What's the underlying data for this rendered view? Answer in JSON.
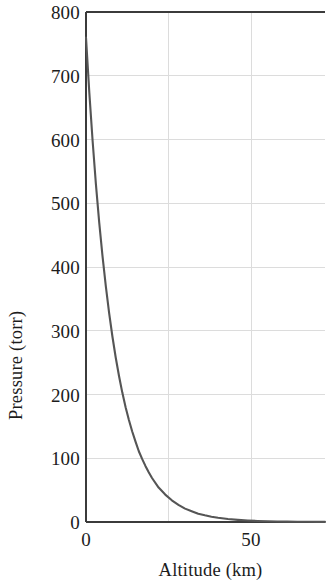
{
  "chart_data": {
    "type": "line",
    "title": "",
    "xlabel": "Altitude (km)",
    "ylabel": "Pressure (torr)",
    "xlim": [
      0,
      72.4
    ],
    "ylim": [
      0,
      800
    ],
    "xticks": [
      "0",
      "50"
    ],
    "xtick_values": [
      0,
      50
    ],
    "yticks": [
      "0",
      "100",
      "200",
      "300",
      "400",
      "500",
      "600",
      "700",
      "800"
    ],
    "ytick_values": [
      0,
      100,
      200,
      300,
      400,
      500,
      600,
      700,
      800
    ],
    "grid": "on",
    "grid_color": "#d8d8d8",
    "legend": "none",
    "frame": "box",
    "series": [
      {
        "name": "Atmospheric pressure",
        "color": "#555555",
        "line_width": 2.1,
        "x": [
          0,
          1,
          2,
          3,
          4,
          5,
          6,
          7,
          8,
          9,
          10,
          11,
          12,
          13,
          14,
          15,
          16,
          17,
          18,
          19,
          20,
          22,
          24,
          26,
          28,
          30,
          32,
          34,
          36,
          38,
          40,
          43,
          46,
          49,
          52,
          55,
          58,
          61,
          64,
          67,
          70,
          72.4
        ],
        "y": [
          760,
          674,
          598,
          530,
          470,
          417,
          370,
          328,
          291,
          258,
          229,
          203,
          180,
          160,
          142,
          126,
          111,
          99,
          88,
          78,
          69,
          54,
          43,
          34,
          27,
          21,
          17,
          13,
          10.5,
          8.3,
          6.6,
          4.6,
          3.3,
          2.3,
          1.6,
          1.2,
          0.8,
          0.6,
          0.4,
          0.3,
          0.2,
          0.15
        ]
      }
    ]
  },
  "axes": {
    "x_tick_labels": [
      {
        "text": "0",
        "value": 0
      },
      {
        "text": "50",
        "value": 50
      }
    ],
    "y_tick_labels": [
      {
        "text": "800",
        "value": 800
      },
      {
        "text": "700",
        "value": 700
      },
      {
        "text": "600",
        "value": 600
      },
      {
        "text": "500",
        "value": 500
      },
      {
        "text": "400",
        "value": 400
      },
      {
        "text": "300",
        "value": 300
      },
      {
        "text": "200",
        "value": 200
      },
      {
        "text": "100",
        "value": 100
      },
      {
        "text": "0",
        "value": 0
      }
    ]
  },
  "colors": {
    "curve": "#555555",
    "frame": "#3b3b3b",
    "grid": "#dcdcdc",
    "text": "#1c1c1c",
    "background": "#ffffff"
  }
}
